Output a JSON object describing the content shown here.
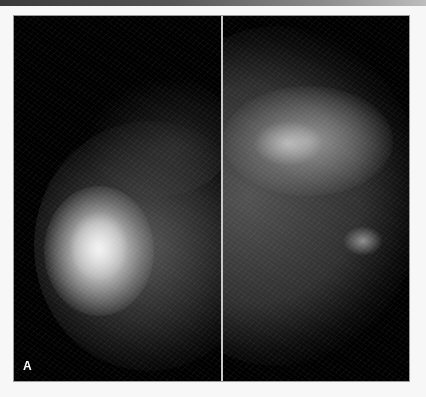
{
  "figure": {
    "panel_label": "A",
    "panels": [
      {
        "name": "left-view",
        "content": "breast tissue with bright dense region at lower-left"
      },
      {
        "name": "right-view",
        "content": "breast tissue with fibroglandular pattern, dense upper area"
      }
    ]
  },
  "colors": {
    "background": "#f7f7f7",
    "image_background": "#000000",
    "divider": "#c9c9c9",
    "label": "#ffffff"
  }
}
